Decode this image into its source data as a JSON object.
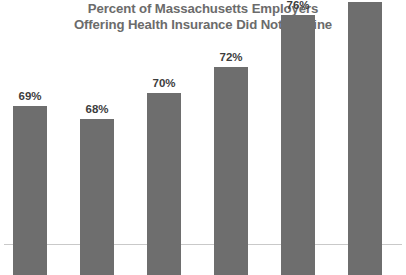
{
  "chart_data": {
    "type": "bar",
    "title": "Percent of Massachusetts Employers Offering Health Insurance Did Not Decline",
    "title_lines": [
      "Percent of Massachusetts Employers",
      "Offering Health Insurance Did Not Decline"
    ],
    "categories": [
      "2001",
      "2003",
      "2005",
      "2007",
      "2009",
      "2010"
    ],
    "values": [
      69,
      68,
      70,
      72,
      76,
      77
    ],
    "value_labels": [
      "69%",
      "68%",
      "70%",
      "72%",
      "76%",
      "77%"
    ],
    "xlabel": "",
    "ylabel": "",
    "ylim": [
      56,
      79
    ],
    "grid": false,
    "legend": false,
    "axis_visible": {
      "x": true,
      "y": false
    },
    "series": [
      {
        "name": "Percent of employers offering health insurance",
        "values": [
          69,
          68,
          70,
          72,
          76,
          77
        ]
      }
    ],
    "colors": {
      "bar_fill": "#6e6e6e",
      "title_text": "#6b6b6b",
      "value_label_text": "#3d3d3d",
      "category_label_text": "#4a4a4a",
      "axis_line": "#c9c9c9",
      "background": "#ffffff"
    }
  }
}
